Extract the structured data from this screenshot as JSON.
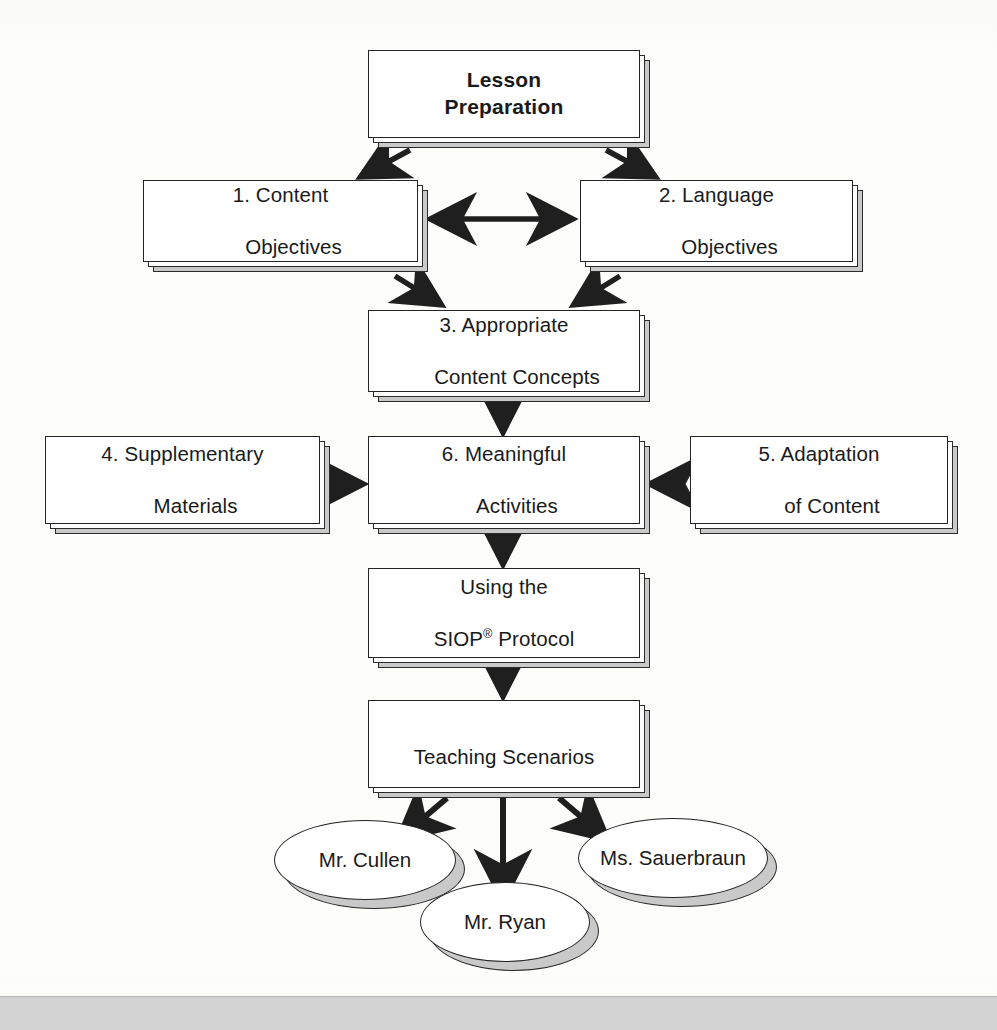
{
  "diagram": {
    "title_node": {
      "id": "lesson-preparation",
      "line1": "Lesson",
      "line2": "Preparation"
    },
    "nodes": [
      {
        "id": "content-objectives",
        "line1": "1. Content",
        "line2": "Objectives"
      },
      {
        "id": "language-objectives",
        "line1": "2. Language",
        "line2": "Objectives"
      },
      {
        "id": "appropriate-content-concepts",
        "line1": "3. Appropriate",
        "line2": "Content Concepts"
      },
      {
        "id": "supplementary-materials",
        "line1": "4. Supplementary",
        "line2": "Materials"
      },
      {
        "id": "meaningful-activities",
        "line1": "6. Meaningful",
        "line2": "Activities"
      },
      {
        "id": "adaptation-of-content",
        "line1": "5. Adaptation",
        "line2": "of Content"
      },
      {
        "id": "using-siop-protocol",
        "line1": "Using the",
        "line2": "SIOP",
        "line2_suffix": " Protocol",
        "line2_superscript": "®"
      },
      {
        "id": "teaching-scenarios",
        "line1": "Teaching Scenarios",
        "line2": ""
      }
    ],
    "scenarios": [
      {
        "id": "mr-cullen",
        "label": "Mr. Cullen"
      },
      {
        "id": "mr-ryan",
        "label": "Mr. Ryan"
      },
      {
        "id": "ms-sauerbraun",
        "label": "Ms. Sauerbraun"
      }
    ],
    "colors": {
      "stroke": "#242424",
      "shadow": "#c9c9c9",
      "face": "#ffffff",
      "arrow": "#1f1f1f",
      "band": "#d2d2d2"
    }
  }
}
